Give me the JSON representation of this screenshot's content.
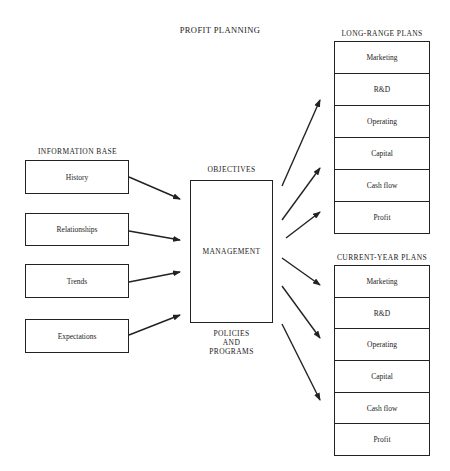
{
  "title": "PROFIT PLANNING",
  "information_base": {
    "heading": "INFORMATION BASE",
    "items": [
      "History",
      "Relationships",
      "Trends",
      "Expectations"
    ]
  },
  "management": {
    "top_label": "OBJECTIVES",
    "center_label": "MANAGEMENT",
    "bottom_label_1": "POLICIES",
    "bottom_label_2": "AND",
    "bottom_label_3": "PROGRAMS"
  },
  "long_range_plans": {
    "heading": "LONG-RANGE PLANS",
    "items": [
      "Marketing",
      "R&D",
      "Operating",
      "Capital",
      "Cash flow",
      "Profit"
    ]
  },
  "current_year_plans": {
    "heading": "CURRENT-YEAR PLANS",
    "items": [
      "Marketing",
      "R&D",
      "Operating",
      "Capital",
      "Cash flow",
      "Profit"
    ]
  }
}
